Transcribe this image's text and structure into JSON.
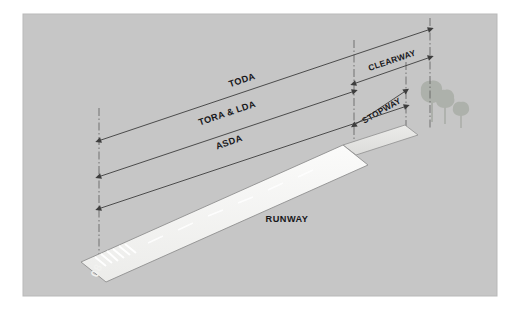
{
  "figure": {
    "panel": {
      "background_color": "#c6c6c6",
      "border_color": "#b4b4b4",
      "outer_background": "#ffffff",
      "x": 23,
      "y": 14,
      "width": 474,
      "height": 282
    }
  },
  "labels": {
    "toda": "TODA",
    "tora_lda": "TORA & LDA",
    "asda": "ASDA",
    "clearway": "CLEARWAY",
    "stopway": "STOPWAY",
    "runway": "RUNWAY",
    "runway_designator": "08"
  },
  "dimensions": [
    {
      "name": "toda",
      "label": "TODA",
      "description": "Take-Off Distance Available",
      "from_datum": "threshold",
      "to_datum": "clearway-end",
      "row": 1
    },
    {
      "name": "tora-lda",
      "label": "TORA & LDA",
      "description": "Take-Off Run Available and Landing Distance Available",
      "from_datum": "threshold",
      "to_datum": "runway-end",
      "row": 2
    },
    {
      "name": "asda",
      "label": "ASDA",
      "description": "Accelerate-Stop Distance Available",
      "from_datum": "threshold",
      "to_datum": "stopway-end",
      "row": 3
    },
    {
      "name": "clearway",
      "label": "CLEARWAY",
      "description": "Clearway segment beyond runway end",
      "from_datum": "runway-end",
      "to_datum": "clearway-end",
      "row": 1
    },
    {
      "name": "stopway",
      "label": "STOPWAY",
      "description": "Stopway segment beyond runway end",
      "from_datum": "runway-end",
      "to_datum": "stopway-end",
      "row": 3
    }
  ],
  "surfaces": {
    "runway": {
      "name": "runway",
      "fill_color": "#f4f4f2",
      "edge_color": "#8f8f8f",
      "has_centerline_dashes": true,
      "has_threshold_stripes": true
    },
    "stopway": {
      "name": "stopway",
      "fill_color": "#e4e4e2",
      "edge_color": "#8f8f8f"
    }
  },
  "scenery": {
    "trees": [
      {
        "name": "tree-large",
        "size": "large"
      },
      {
        "name": "tree-medium",
        "size": "medium"
      },
      {
        "name": "tree-small",
        "size": "small"
      }
    ],
    "tree_color": "#9aa095"
  },
  "colors": {
    "panel_bg": "#c6c6c6",
    "line": "#4a4a4a",
    "datum_line": "#555555",
    "text": "#17171a",
    "runway_fill": "#f4f4f2",
    "stopway_fill": "#e4e4e2",
    "tree": "#9aa095"
  }
}
